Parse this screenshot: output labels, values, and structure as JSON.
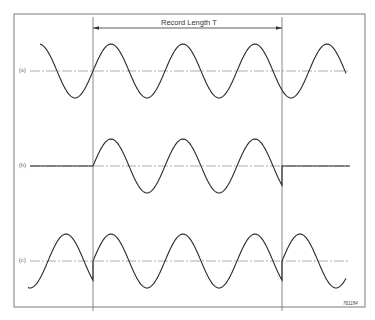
{
  "figure": {
    "record_length_label": "Record Length T",
    "figure_id": "761184",
    "traces": [
      {
        "id": "a",
        "label": "(a)",
        "description": "Continuous sine wave",
        "axis_y": 71
      },
      {
        "id": "b",
        "label": "(b)",
        "description": "Sine wave truncated to record length (zero outside)",
        "axis_y": 166
      },
      {
        "id": "c",
        "label": "(c)",
        "description": "Record periodically repeated, showing discontinuities at boundaries",
        "axis_y": 261
      }
    ],
    "window": {
      "x_start": 93,
      "x_end": 282
    },
    "wave": {
      "amplitude_px": 27,
      "period_px": 72,
      "x_start": 40,
      "x_end": 346,
      "phase_ref_x": 93
    },
    "frame": {
      "left": 14,
      "top": 14,
      "right": 365,
      "bottom": 307
    },
    "colors": {
      "line": "#2a2a2a",
      "frame": "#7a7a7a",
      "axis": "#8a8a8a",
      "window_line": "#6a6a6a"
    }
  }
}
